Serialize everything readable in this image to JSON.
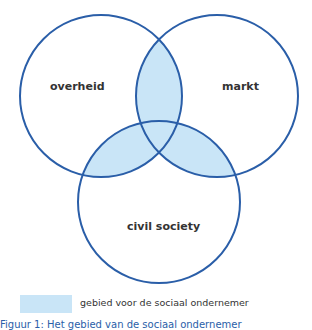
{
  "colors": {
    "stroke": "#2a5ea8",
    "fill": "#c9e5f7",
    "text": "#333333"
  },
  "diagram": {
    "type": "venn",
    "circles": [
      {
        "id": "overheid",
        "label": "overheid",
        "cx": 101,
        "cy": 96,
        "r": 81
      },
      {
        "id": "markt",
        "label": "markt",
        "cx": 217,
        "cy": 96,
        "r": 81
      },
      {
        "id": "civil-society",
        "label": "civil society",
        "cx": 159,
        "cy": 202,
        "r": 81
      }
    ],
    "highlighted_region": "pairwise overlaps"
  },
  "labels": {
    "overheid": "overheid",
    "markt": "markt",
    "civil_society": "civil society"
  },
  "legend": {
    "text": "gebied voor de sociaal ondernemer"
  },
  "caption": {
    "text": "Figuur 1: Het gebied van de sociaal ondernemer"
  }
}
